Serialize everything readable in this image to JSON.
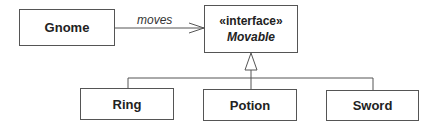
{
  "diagram": {
    "type": "uml-class-diagram",
    "classes": [
      {
        "id": "gnome",
        "name": "Gnome"
      },
      {
        "id": "ring",
        "name": "Ring"
      },
      {
        "id": "potion",
        "name": "Potion"
      },
      {
        "id": "sword",
        "name": "Sword"
      }
    ],
    "interface": {
      "id": "movable",
      "stereotype": "«interface»",
      "name": "Movable"
    },
    "relationships": [
      {
        "from": "Gnome",
        "to": "Movable",
        "kind": "association",
        "label": "moves",
        "arrow": "open-arrow"
      },
      {
        "from": "Ring",
        "to": "Movable",
        "kind": "realization",
        "arrow": "hollow-triangle"
      },
      {
        "from": "Potion",
        "to": "Movable",
        "kind": "realization",
        "arrow": "hollow-triangle"
      },
      {
        "from": "Sword",
        "to": "Movable",
        "kind": "realization",
        "arrow": "hollow-triangle"
      }
    ],
    "colors": {
      "line": "#555555",
      "text": "#222222",
      "background": "#ffffff"
    }
  }
}
